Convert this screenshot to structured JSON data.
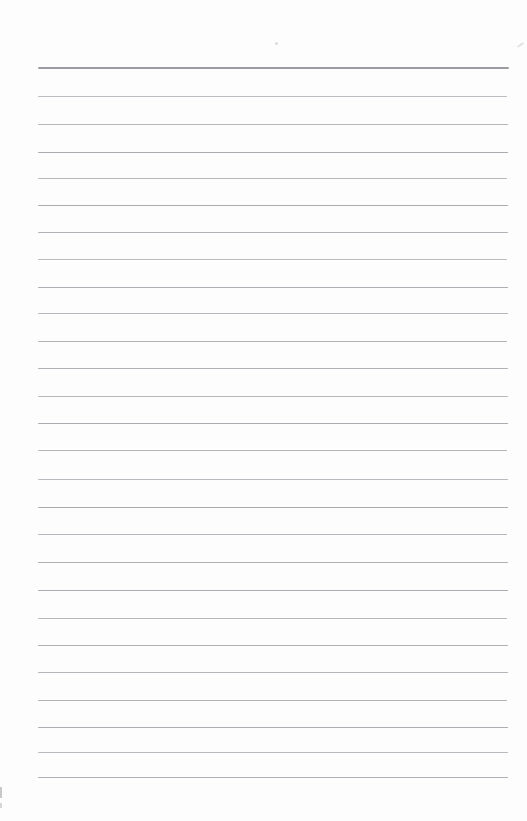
{
  "page": {
    "background_color": "#fdfdfd",
    "text_content": "",
    "lines": [
      {
        "role": "header-rule",
        "x": 38,
        "y": 67,
        "w": 471,
        "h": 2,
        "color": "#9a9ca0"
      },
      {
        "role": "ruled-line",
        "x": 38,
        "y": 96,
        "w": 469,
        "h": 1,
        "color": "#b9bcc0"
      },
      {
        "role": "ruled-line",
        "x": 38,
        "y": 124,
        "w": 470,
        "h": 1,
        "color": "#b3b6ba"
      },
      {
        "role": "ruled-line",
        "x": 38,
        "y": 151.5,
        "w": 470,
        "h": 1,
        "color": "#a8abb0"
      },
      {
        "role": "ruled-line",
        "x": 38,
        "y": 178,
        "w": 469,
        "h": 1,
        "color": "#b6b9bd"
      },
      {
        "role": "ruled-line",
        "x": 38,
        "y": 205,
        "w": 470,
        "h": 1,
        "color": "#aaadb2"
      },
      {
        "role": "ruled-line",
        "x": 38,
        "y": 232,
        "w": 470,
        "h": 1,
        "color": "#b0b3b8"
      },
      {
        "role": "ruled-line",
        "x": 38,
        "y": 259,
        "w": 469,
        "h": 1,
        "color": "#b8bbbf"
      },
      {
        "role": "ruled-line",
        "x": 38,
        "y": 286.5,
        "w": 470,
        "h": 1,
        "color": "#abaeb3"
      },
      {
        "role": "ruled-line",
        "x": 38,
        "y": 313,
        "w": 470,
        "h": 1,
        "color": "#b4b7bb"
      },
      {
        "role": "ruled-line",
        "x": 38,
        "y": 340.5,
        "w": 469,
        "h": 1,
        "color": "#b0b3b8"
      },
      {
        "role": "ruled-line",
        "x": 38,
        "y": 368,
        "w": 470,
        "h": 1,
        "color": "#aeb1b6"
      },
      {
        "role": "ruled-line",
        "x": 38,
        "y": 395.5,
        "w": 470,
        "h": 1,
        "color": "#b6b9bd"
      },
      {
        "role": "ruled-line",
        "x": 38,
        "y": 422.5,
        "w": 470,
        "h": 1,
        "color": "#a9acb1"
      },
      {
        "role": "ruled-line",
        "x": 38,
        "y": 450,
        "w": 469,
        "h": 1,
        "color": "#b2b5b9"
      },
      {
        "role": "ruled-line",
        "x": 38,
        "y": 478.5,
        "w": 470,
        "h": 1,
        "color": "#b7babe"
      },
      {
        "role": "ruled-line",
        "x": 38,
        "y": 506.5,
        "w": 470,
        "h": 1,
        "color": "#a9acb1"
      },
      {
        "role": "ruled-line",
        "x": 38,
        "y": 534,
        "w": 469,
        "h": 1,
        "color": "#b3b6ba"
      },
      {
        "role": "ruled-line",
        "x": 38,
        "y": 562,
        "w": 470,
        "h": 1,
        "color": "#aeb1b6"
      },
      {
        "role": "ruled-line",
        "x": 38,
        "y": 590,
        "w": 470,
        "h": 1,
        "color": "#a9acb1"
      },
      {
        "role": "ruled-line",
        "x": 38,
        "y": 617.5,
        "w": 469,
        "h": 1,
        "color": "#b5b8bc"
      },
      {
        "role": "ruled-line",
        "x": 38,
        "y": 644.5,
        "w": 470,
        "h": 1,
        "color": "#aeb1b6"
      },
      {
        "role": "ruled-line",
        "x": 38,
        "y": 672,
        "w": 470,
        "h": 1,
        "color": "#b2b5b9"
      },
      {
        "role": "ruled-line",
        "x": 38,
        "y": 699.5,
        "w": 469,
        "h": 1,
        "color": "#b0b3b8"
      },
      {
        "role": "ruled-line",
        "x": 38,
        "y": 727,
        "w": 470,
        "h": 1,
        "color": "#aaadb2"
      },
      {
        "role": "ruled-line",
        "x": 38,
        "y": 751.5,
        "w": 470,
        "h": 1,
        "color": "#b7babe"
      },
      {
        "role": "ruled-line",
        "x": 38,
        "y": 777,
        "w": 470,
        "h": 1,
        "color": "#acafb4"
      }
    ],
    "specks": [
      {
        "role": "dust-speck",
        "x": 275,
        "y": 42,
        "w": 3,
        "h": 3,
        "color": "#dcdcdc",
        "round": true,
        "rotate": 0
      },
      {
        "role": "scratch-mark",
        "x": 517,
        "y": 44,
        "w": 7,
        "h": 2,
        "color": "#e2e2e2",
        "round": false,
        "rotate": -35
      },
      {
        "role": "edge-smudge",
        "x": 0,
        "y": 787,
        "w": 2,
        "h": 11,
        "color": "#c8c8c8",
        "round": false,
        "rotate": 0
      },
      {
        "role": "edge-smudge-small",
        "x": 0,
        "y": 803,
        "w": 2,
        "h": 5,
        "color": "#d6d6d6",
        "round": false,
        "rotate": 0
      }
    ]
  }
}
